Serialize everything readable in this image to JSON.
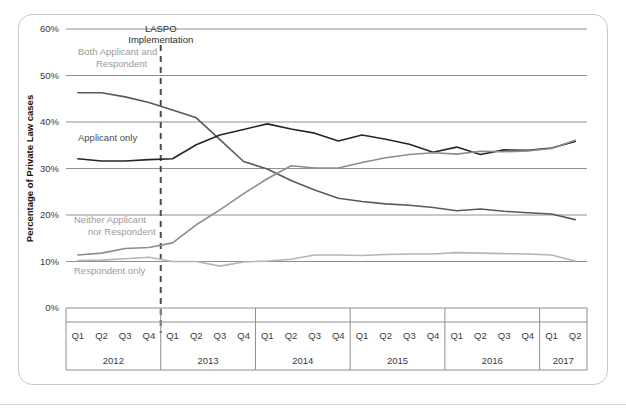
{
  "figure": {
    "y_axis_title": "Percentage of Private Law cases",
    "annotation_laspo_line1": "LASPO",
    "annotation_laspo_line2": "Implementation",
    "annotation_both": "Both Applicant and",
    "annotation_both2": "Respondent",
    "annotation_applicant": "Applicant only",
    "annotation_neither": "Neither Applicant",
    "annotation_neither2": "nor Respondent",
    "annotation_respondent": "Respondent only"
  },
  "colors": {
    "both_applicant_and_respondent": "#595959",
    "applicant_only": "#262626",
    "respondent_only": "#b5b5b5",
    "neither_applicant_nor_respondent": "#8c8c8c",
    "gridline": "#8f8f8f",
    "laspo_dash": "#4d4d4d",
    "annotation_gray": "#9b9b9b",
    "card_border": "#c9c9c9"
  },
  "legend": {
    "items": [
      {
        "label": "Both Applicant and Respondent",
        "color": "#595959"
      },
      {
        "label": "Applicant only",
        "color": "#262626"
      },
      {
        "label": "Respondent only",
        "color": "#b5b5b5"
      },
      {
        "label": "Neither Applicant nor Respondent",
        "color": "#8c8c8c"
      }
    ]
  },
  "chart_data": {
    "type": "line",
    "title": "",
    "xlabel": "",
    "ylabel": "Percentage of Private Law cases",
    "ylim": [
      0,
      60
    ],
    "ytick_labels": [
      "0%",
      "10%",
      "20%",
      "30%",
      "40%",
      "50%",
      "60%"
    ],
    "ytick_values": [
      0,
      10,
      20,
      30,
      40,
      50,
      60
    ],
    "grid": true,
    "legend_position": "bottom",
    "quarter_labels": [
      "Q1",
      "Q2",
      "Q3",
      "Q4",
      "Q1",
      "Q2",
      "Q3",
      "Q4",
      "Q1",
      "Q2",
      "Q3",
      "Q4",
      "Q1",
      "Q2",
      "Q3",
      "Q4",
      "Q1",
      "Q2",
      "Q3",
      "Q4",
      "Q1",
      "Q2"
    ],
    "year_groups": [
      {
        "year": "2012",
        "quarters": 4
      },
      {
        "year": "2013",
        "quarters": 4
      },
      {
        "year": "2014",
        "quarters": 4
      },
      {
        "year": "2015",
        "quarters": 4
      },
      {
        "year": "2016",
        "quarters": 4
      },
      {
        "year": "2017",
        "quarters": 2
      }
    ],
    "annotations": [
      {
        "name": "laspo-implementation",
        "text": "LASPO Implementation",
        "x_index": 4,
        "style": "vertical-dashed"
      }
    ],
    "series": [
      {
        "name": "Both Applicant and Respondent",
        "color": "#595959",
        "values": [
          46.3,
          46.3,
          45.4,
          44.2,
          42.6,
          40.9,
          36.2,
          31.5,
          29.9,
          27.4,
          25.4,
          23.6,
          22.9,
          22.4,
          22.1,
          21.6,
          20.9,
          21.3,
          20.8,
          20.5,
          20.2,
          19.0
        ]
      },
      {
        "name": "Applicant only",
        "color": "#262626",
        "values": [
          32.1,
          31.6,
          31.6,
          31.9,
          32.1,
          35.1,
          37.2,
          38.4,
          39.6,
          38.5,
          37.6,
          35.9,
          37.2,
          36.3,
          35.2,
          33.5,
          34.6,
          33.0,
          34.0,
          33.9,
          34.4,
          35.8
        ]
      },
      {
        "name": "Respondent only",
        "color": "#b5b5b5",
        "values": [
          10.2,
          10.3,
          10.6,
          10.9,
          10.0,
          10.0,
          9.0,
          9.9,
          10.1,
          10.5,
          11.4,
          11.4,
          11.3,
          11.5,
          11.6,
          11.6,
          11.9,
          11.8,
          11.7,
          11.6,
          11.4,
          10.1
        ]
      },
      {
        "name": "Neither Applicant nor Respondent",
        "color": "#8c8c8c",
        "values": [
          11.4,
          11.8,
          12.8,
          13.0,
          14.0,
          17.9,
          21.1,
          24.6,
          27.8,
          30.6,
          30.1,
          30.1,
          31.3,
          32.3,
          33.0,
          33.4,
          33.1,
          33.7,
          33.6,
          33.8,
          34.3,
          36.1
        ]
      }
    ]
  }
}
